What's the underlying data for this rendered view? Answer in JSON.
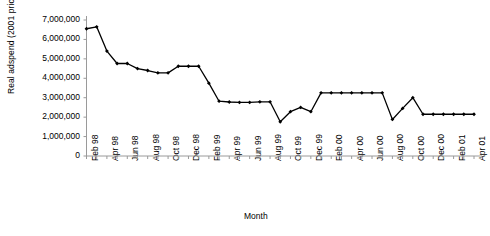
{
  "chart_data": {
    "type": "line",
    "title": "",
    "xlabel": "Month",
    "ylabel": "Real adspend (2001 prices) (£)",
    "grid": false,
    "legend": "none",
    "marker": "filled-diamond",
    "line_color": "#000000",
    "ylim": [
      0,
      7000000
    ],
    "ytick_labels": [
      "7,000,000",
      "6,000,000",
      "5,000,000",
      "4,000,000",
      "3,000,000",
      "2,000,000",
      "1,000,000",
      "0"
    ],
    "ytick_values": [
      7000000,
      6000000,
      5000000,
      4000000,
      3000000,
      2000000,
      1000000,
      0
    ],
    "categories": [
      "Feb 98",
      "Mar 98",
      "Apr 98",
      "May 98",
      "Jun 98",
      "Jul 98",
      "Aug 98",
      "Sep 98",
      "Oct 98",
      "Nov 98",
      "Dec 98",
      "Jan 99",
      "Feb 99",
      "Mar 99",
      "Apr 99",
      "May 99",
      "Jun 99",
      "Jul 99",
      "Aug 99",
      "Sep 99",
      "Oct 99",
      "Nov 99",
      "Dec 99",
      "Jan 00",
      "Feb 00",
      "Mar 00",
      "Apr 00",
      "May 00",
      "Jun 00",
      "Jul 00",
      "Aug 00",
      "Sep 00",
      "Oct 00",
      "Nov 00",
      "Dec 00",
      "Jan 01",
      "Feb 01",
      "Mar 01",
      "Apr 01"
    ],
    "xtick_labels": [
      "Feb 98",
      "Apr 98",
      "Jun 98",
      "Aug 98",
      "Oct 98",
      "Dec 98",
      "Feb 99",
      "Apr 99",
      "Jun 99",
      "Aug 99",
      "Oct 99",
      "Dec 99",
      "Feb 00",
      "Apr 00",
      "Jun 00",
      "Aug 00",
      "Oct 00",
      "Dec 00",
      "Feb 01",
      "Apr 01"
    ],
    "values": [
      6550000,
      6650000,
      5400000,
      4760000,
      4760000,
      4500000,
      4400000,
      4280000,
      4280000,
      4620000,
      4620000,
      4620000,
      3750000,
      2820000,
      2780000,
      2760000,
      2760000,
      2790000,
      2790000,
      1760000,
      2280000,
      2500000,
      2280000,
      3250000,
      3250000,
      3250000,
      3250000,
      3250000,
      3250000,
      3250000,
      1880000,
      2450000,
      3000000,
      2150000,
      2150000,
      2150000,
      2150000,
      2150000,
      2150000
    ]
  }
}
